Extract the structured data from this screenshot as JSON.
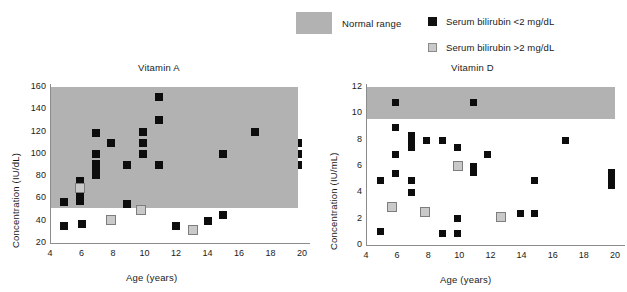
{
  "legend": {
    "range_label": "Normal range",
    "range_color": "#b2b2b2",
    "items": [
      {
        "label": "Serum bilirubin <2 mg/dL",
        "marker": "black-square",
        "color": "#111111"
      },
      {
        "label": "Serum bilirubin >2 mg/dL",
        "marker": "gray-square",
        "color": "#c9c9c9"
      }
    ]
  },
  "chart_data": [
    {
      "type": "scatter",
      "title": "Vitamin A",
      "xlabel": "Age (years)",
      "ylabel": "Concentration (IU/dL)",
      "xlim": [
        4,
        20
      ],
      "ylim": [
        20,
        160
      ],
      "xticks": [
        4,
        6,
        8,
        10,
        12,
        14,
        16,
        18,
        20
      ],
      "yticks": [
        20,
        40,
        60,
        80,
        100,
        120,
        140,
        160
      ],
      "grid": false,
      "normal_range": {
        "ymin": 51,
        "ymax": 160,
        "xmin": 4,
        "xmax": 20,
        "color": "#b2b2b2"
      },
      "series": [
        {
          "name": "Serum bilirubin <2 mg/dL",
          "marker": "black-square",
          "points": [
            [
              4.9,
              57
            ],
            [
              4.9,
              35
            ],
            [
              5.9,
              76
            ],
            [
              5.9,
              62
            ],
            [
              5.9,
              58
            ],
            [
              6.0,
              37
            ],
            [
              6.9,
              119
            ],
            [
              6.9,
              100
            ],
            [
              6.9,
              91
            ],
            [
              6.9,
              86
            ],
            [
              6.9,
              81
            ],
            [
              7.9,
              110
            ],
            [
              8.9,
              90
            ],
            [
              8.9,
              55
            ],
            [
              9.9,
              120
            ],
            [
              9.9,
              110
            ],
            [
              9.9,
              100
            ],
            [
              10.9,
              151
            ],
            [
              10.9,
              130
            ],
            [
              10.9,
              90
            ],
            [
              12.0,
              35
            ],
            [
              14.0,
              40
            ],
            [
              15.0,
              100
            ],
            [
              15.0,
              45
            ],
            [
              17.0,
              120
            ],
            [
              20.0,
              110
            ],
            [
              20.0,
              100
            ],
            [
              20.0,
              90
            ]
          ]
        },
        {
          "name": "Serum bilirubin >2 mg/dL",
          "marker": "gray-square",
          "points": [
            [
              5.9,
              69
            ],
            [
              7.9,
              41
            ],
            [
              9.8,
              50
            ],
            [
              13.1,
              32
            ]
          ]
        }
      ]
    },
    {
      "type": "scatter",
      "title": "Vitamin D",
      "xlabel": "Age (years)",
      "ylabel": "Concentration (IU/mL)",
      "xlim": [
        4,
        20
      ],
      "ylim": [
        0,
        12
      ],
      "xticks": [
        4,
        6,
        8,
        10,
        12,
        14,
        16,
        18,
        20
      ],
      "yticks": [
        0,
        2,
        4,
        6,
        8,
        10,
        12
      ],
      "grid": false,
      "normal_range": {
        "ymin": 9.6,
        "ymax": 12.4,
        "xmin": 4,
        "xmax": 20,
        "color": "#b2b2b2"
      },
      "series": [
        {
          "name": "Serum bilirubin <2 mg/dL",
          "marker": "black-square",
          "points": [
            [
              4.9,
              4.9
            ],
            [
              4.9,
              1.0
            ],
            [
              5.9,
              10.8
            ],
            [
              5.9,
              8.9
            ],
            [
              5.9,
              6.9
            ],
            [
              5.9,
              5.4
            ],
            [
              6.9,
              8.3
            ],
            [
              6.9,
              7.8
            ],
            [
              6.9,
              7.4
            ],
            [
              6.9,
              4.9
            ],
            [
              6.9,
              4.0
            ],
            [
              7.9,
              7.9
            ],
            [
              8.9,
              7.9
            ],
            [
              8.9,
              0.9
            ],
            [
              9.9,
              7.4
            ],
            [
              9.9,
              2.0
            ],
            [
              9.9,
              0.9
            ],
            [
              10.9,
              10.8
            ],
            [
              10.9,
              6.0
            ],
            [
              10.9,
              5.5
            ],
            [
              11.8,
              6.9
            ],
            [
              13.9,
              2.4
            ],
            [
              14.8,
              4.9
            ],
            [
              14.8,
              2.4
            ],
            [
              16.8,
              7.9
            ],
            [
              19.8,
              5.5
            ],
            [
              19.8,
              5.0
            ],
            [
              19.8,
              4.5
            ]
          ]
        },
        {
          "name": "Serum bilirubin >2 mg/dL",
          "marker": "gray-square",
          "points": [
            [
              5.7,
              2.9
            ],
            [
              7.8,
              2.5
            ],
            [
              9.9,
              6.0
            ],
            [
              12.7,
              2.1
            ]
          ]
        }
      ]
    }
  ]
}
